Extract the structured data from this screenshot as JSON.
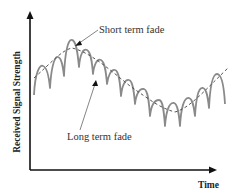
{
  "diagram": {
    "axes": {
      "x_label": "Time",
      "y_label": "Received Signal Strength"
    },
    "annotations": {
      "short_term": "Short term fade",
      "long_term": "Long term fade"
    },
    "colors": {
      "axis": "#111111",
      "signal": "#8a8a8a",
      "trend": "#555555",
      "text": "#333333"
    },
    "signal_peaks": [
      {
        "x": 43,
        "y": 66
      },
      {
        "x": 57,
        "y": 57
      },
      {
        "x": 71,
        "y": 40
      },
      {
        "x": 86,
        "y": 50
      },
      {
        "x": 100,
        "y": 60
      },
      {
        "x": 115,
        "y": 70
      },
      {
        "x": 129,
        "y": 80
      },
      {
        "x": 144,
        "y": 89
      },
      {
        "x": 159,
        "y": 100
      },
      {
        "x": 174,
        "y": 103
      },
      {
        "x": 188,
        "y": 98
      },
      {
        "x": 202,
        "y": 87
      },
      {
        "x": 217,
        "y": 75
      }
    ]
  }
}
